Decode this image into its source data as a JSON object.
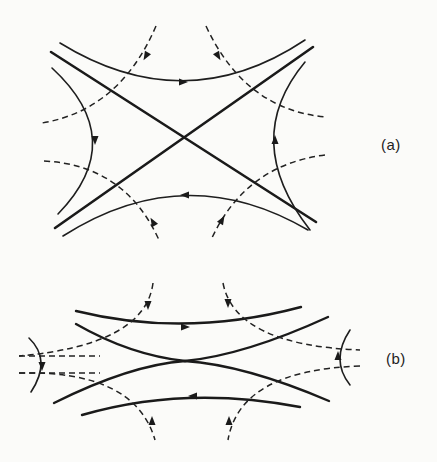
{
  "figure": {
    "colors": {
      "ink": "#1e1e1e",
      "paper": "#fbfbf9"
    },
    "panels": [
      {
        "id": "a",
        "label": "(a)",
        "label_pos": [
          381,
          146
        ],
        "thick_paths": [
          "M51,52 L316,222",
          "M55,228 L313,47"
        ],
        "solid_paths": [
          "M60,43 Q185,120 305,40",
          "M63,236 Q185,158 308,230",
          "M52,68 Q130,140 58,214",
          "M305,62 Q240,140 310,230"
        ],
        "dashed_paths": [
          "M156,26 Q120,110 42,123",
          "M206,26 Q245,110 326,117",
          "M44,161 Q125,165 159,240",
          "M325,155 Q245,165 211,240"
        ],
        "arrows": [
          {
            "x": 183,
            "y": 82,
            "dir": "right"
          },
          {
            "x": 185,
            "y": 195,
            "dir": "left"
          },
          {
            "x": 95,
            "y": 140,
            "dir": "down"
          },
          {
            "x": 275,
            "y": 140,
            "dir": "up"
          },
          {
            "x": 146,
            "y": 56,
            "dir": "down-left"
          },
          {
            "x": 218,
            "y": 56,
            "dir": "down-right"
          },
          {
            "x": 153,
            "y": 222,
            "dir": "up-left"
          },
          {
            "x": 222,
            "y": 220,
            "dir": "up-right"
          }
        ]
      },
      {
        "id": "b",
        "label": "(b)",
        "label_pos": [
          386,
          360
        ],
        "thick_paths": [
          "M76,324 Q130,355 185,361 Q245,355 328,317",
          "M54,403 Q130,365 185,361 Q245,365 329,401",
          "M76,311 Q185,338 301,307",
          "M82,415 Q185,385 300,407"
        ],
        "solid_paths": [
          "M29,338 Q52,360 31,392",
          "M350,330 Q330,360 350,385"
        ],
        "dashed_paths": [
          "M153,283 Q145,345 19,356",
          "M223,283 Q235,345 360,350",
          "M19,373 Q135,370 155,440",
          "M360,366 Q240,370 228,440"
        ],
        "dashed_straight": [
          "M19,356 L100,356",
          "M19,373 L100,373"
        ],
        "arrows": [
          {
            "x": 185,
            "y": 327,
            "dir": "right"
          },
          {
            "x": 193,
            "y": 396,
            "dir": "left"
          },
          {
            "x": 42,
            "y": 366,
            "dir": "down"
          },
          {
            "x": 338,
            "y": 356,
            "dir": "up"
          },
          {
            "x": 148,
            "y": 305,
            "dir": "down"
          },
          {
            "x": 228,
            "y": 303,
            "dir": "down"
          },
          {
            "x": 152,
            "y": 421,
            "dir": "up"
          },
          {
            "x": 229,
            "y": 421,
            "dir": "up"
          }
        ]
      }
    ]
  }
}
